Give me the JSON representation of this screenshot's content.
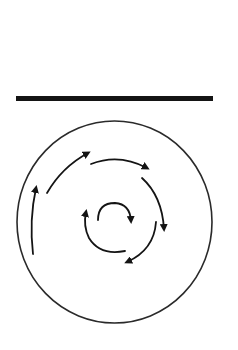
{
  "diagram": {
    "type": "circulation-diagram",
    "colors": {
      "background": "#ffffff",
      "ink": "#141414",
      "circle_stroke": "#2a2a2a"
    },
    "bar": {
      "x1": 16,
      "x2": 213,
      "y": 98.5,
      "thickness": 5
    },
    "circle": {
      "cx": 114.5,
      "cy": 222,
      "rx": 97.5,
      "ry": 101,
      "stroke_width": 1.6
    },
    "arrows": [
      {
        "id": "outer-left",
        "path": "M 33 254 Q 29 220 36 188",
        "direction": "up"
      },
      {
        "id": "outer-upper-left",
        "path": "M 47 193 Q 62 167 88 153",
        "direction": "up-right"
      },
      {
        "id": "outer-top",
        "path": "M 91 164 Q 119 153 147 168",
        "direction": "right"
      },
      {
        "id": "outer-right",
        "path": "M 142 178 Q 162 196 164 229",
        "direction": "down"
      },
      {
        "id": "outer-lower-right",
        "path": "M 156 222 Q 154 250 127 262",
        "direction": "down-left"
      },
      {
        "id": "inner-left",
        "path": "M 125 251 Q 100 256 89 238 Q 83 226 86 212",
        "direction": "up"
      },
      {
        "id": "inner-top",
        "path": "M 98 220 Q 98 203 115 203 Q 130 204 131 221",
        "direction": "down"
      }
    ],
    "rotation": "clockwise"
  }
}
